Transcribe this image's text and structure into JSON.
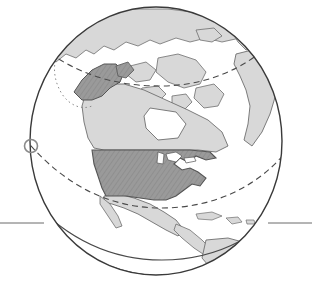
{
  "figure": {
    "kind": "globe-illustration",
    "width": 312,
    "height": 286,
    "background": "#ffffff"
  },
  "colors": {
    "ocean": "#ffffff",
    "land_other": "#d8d8d8",
    "land_other_stroke": "#6e6e6e",
    "land_highlight": "#9a9a9a",
    "land_highlight_hatch": "#8a8a8a",
    "land_highlight_stroke": "#555555",
    "globe_outline": "#3a3a3a",
    "graticule_dashed": "#4a4a4a",
    "band_line": "#4a4a4a",
    "horizon_rule": "#6a6a6a",
    "marker_circle": "#8a8a8a"
  },
  "globe": {
    "center_x": 156,
    "center_y": 141,
    "radius_x": 126,
    "radius_y": 134,
    "outline_width": 1.4
  },
  "graticules": [
    {
      "name": "arctic-circle",
      "style": "dashed",
      "dash": "6 4"
    },
    {
      "name": "tropic-of-cancer",
      "style": "dashed",
      "dash": "6 4"
    }
  ],
  "band": {
    "name": "equatorial-band",
    "line_count": 2,
    "style": "solid"
  },
  "marker": {
    "name": "limb-marker-circle",
    "cx": 31,
    "cy": 146,
    "r": 6.5,
    "stroke_width": 1.6
  },
  "horizon_rule": {
    "name": "horizon-rule",
    "y": 223,
    "left_x1": 0,
    "left_x2": 44,
    "right_x1": 268,
    "right_x2": 312,
    "stroke_width": 1
  },
  "regions": [
    {
      "id": "united-states-contiguous",
      "label": "Contiguous United States",
      "fill": "highlight"
    },
    {
      "id": "alaska",
      "label": "Alaska",
      "fill": "highlight"
    },
    {
      "id": "canada",
      "label": "Canada",
      "fill": "other"
    },
    {
      "id": "greenland",
      "label": "Greenland",
      "fill": "other"
    },
    {
      "id": "mexico",
      "label": "Mexico",
      "fill": "other"
    },
    {
      "id": "central-america",
      "label": "Central America",
      "fill": "other"
    },
    {
      "id": "south-america-north",
      "label": "Northern South America",
      "fill": "other"
    },
    {
      "id": "caribbean-islands",
      "label": "Caribbean Islands",
      "fill": "other"
    },
    {
      "id": "canadian-arctic-archipelago",
      "label": "Canadian Arctic Archipelago",
      "fill": "other"
    },
    {
      "id": "siberia-asia",
      "label": "Siberia / Northeast Asia",
      "fill": "other"
    },
    {
      "id": "iceland-scandinavia",
      "label": "Iceland / Scandinavia",
      "fill": "other"
    }
  ],
  "legend": {
    "highlight_meaning": "Highlighted country (United States including Alaska)",
    "other_meaning": "Other landmasses"
  }
}
